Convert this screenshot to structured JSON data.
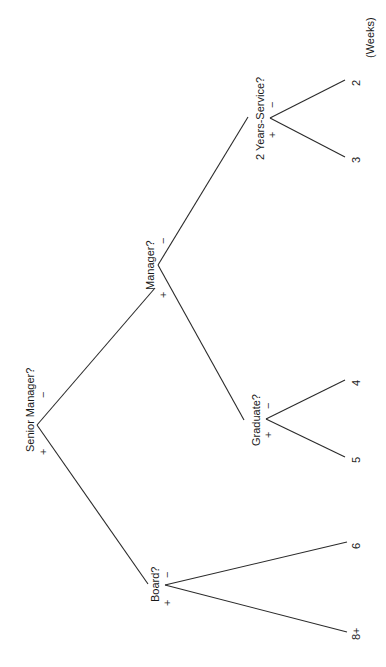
{
  "diagram": {
    "type": "decision-tree",
    "orientation": "rotated-90-ccw",
    "units_label": "(Weeks)",
    "nodes": {
      "senior_manager": {
        "label": "Senior Manager?",
        "plus": "+",
        "minus": "−"
      },
      "manager": {
        "label": "Manager?",
        "plus": "+",
        "minus": "−"
      },
      "years_service": {
        "label": "2 Years-Service?",
        "plus": "+",
        "minus": "−"
      },
      "graduate": {
        "label": "Graduate?",
        "plus": "+",
        "minus": "−"
      },
      "board": {
        "label": "Board?",
        "plus": "+",
        "minus": "−"
      }
    },
    "leaves": {
      "years_service_minus": "2",
      "years_service_plus": "3",
      "graduate_minus": "4",
      "graduate_plus": "5",
      "board_minus": "6",
      "board_plus": "8+"
    },
    "edges": [
      {
        "from": "Senior Manager?",
        "branch": "−",
        "to": "Manager?"
      },
      {
        "from": "Senior Manager?",
        "branch": "+",
        "to": "Board?"
      },
      {
        "from": "Manager?",
        "branch": "−",
        "to": "2 Years-Service?"
      },
      {
        "from": "Manager?",
        "branch": "+",
        "to": "Graduate?"
      },
      {
        "from": "2 Years-Service?",
        "branch": "−",
        "to": "2"
      },
      {
        "from": "2 Years-Service?",
        "branch": "+",
        "to": "3"
      },
      {
        "from": "Graduate?",
        "branch": "−",
        "to": "4"
      },
      {
        "from": "Graduate?",
        "branch": "+",
        "to": "5"
      },
      {
        "from": "Board?",
        "branch": "−",
        "to": "6"
      },
      {
        "from": "Board?",
        "branch": "+",
        "to": "8+"
      }
    ],
    "colors": {
      "line": "#2a2a2a",
      "text": "#1a1a1a",
      "background": "#ffffff"
    }
  }
}
